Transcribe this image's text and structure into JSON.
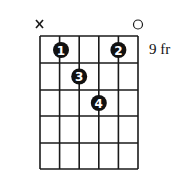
{
  "diagram": {
    "type": "guitar-chord-diagram",
    "strings": 6,
    "frets_shown": 5,
    "fret_position_label": "9 fr",
    "string_markers": [
      {
        "string": 1,
        "marker": "x"
      },
      {
        "string": 6,
        "marker": "o"
      }
    ],
    "fingers": [
      {
        "finger": "1",
        "string": 2,
        "fret": 1
      },
      {
        "finger": "2",
        "string": 5,
        "fret": 1
      },
      {
        "finger": "3",
        "string": 3,
        "fret": 2
      },
      {
        "finger": "4",
        "string": 4,
        "fret": 3
      }
    ],
    "colors": {
      "line": "#1a1a1a",
      "dot": "#111111",
      "dot_text": "#ffffff"
    }
  }
}
